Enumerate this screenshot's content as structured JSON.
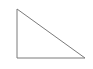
{
  "diagram": {
    "shape": "right-triangle",
    "vertices": [
      [
        17,
        9
      ],
      [
        17,
        58
      ],
      [
        85,
        58
      ]
    ],
    "stroke_color": "#7a7a7a",
    "fill_color": "#ffffff",
    "stroke_width": 1
  }
}
